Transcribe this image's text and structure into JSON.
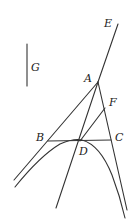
{
  "diagram": {
    "type": "geometric-figure",
    "stroke_color": "#333333",
    "labels": {
      "E": "E",
      "G": "G",
      "A": "A",
      "F": "F",
      "B": "B",
      "C": "C",
      "D": "D"
    },
    "points": {
      "A": [
        98,
        82
      ],
      "B": [
        48,
        141
      ],
      "C": [
        111,
        141
      ],
      "D": [
        80,
        141
      ],
      "F": [
        104,
        107
      ],
      "E_end": [
        118,
        24
      ]
    },
    "segment_G": {
      "x": 27,
      "y1": 44,
      "y2": 86
    }
  }
}
